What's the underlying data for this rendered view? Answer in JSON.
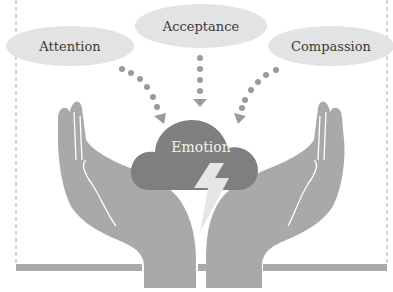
{
  "diagram": {
    "concepts": [
      {
        "id": "attention",
        "label": "Attention"
      },
      {
        "id": "acceptance",
        "label": "Acceptance"
      },
      {
        "id": "compassion",
        "label": "Compassion"
      }
    ],
    "center": {
      "label": "Emotion",
      "shape": "cloud",
      "icon": "lightning-bolt-icon"
    },
    "support": {
      "shape": "two-open-hands"
    },
    "edges": [
      {
        "from": "attention",
        "to": "emotion",
        "style": "dotted-arrow"
      },
      {
        "from": "acceptance",
        "to": "emotion",
        "style": "dotted-arrow"
      },
      {
        "from": "compassion",
        "to": "emotion",
        "style": "dotted-arrow"
      }
    ],
    "colors": {
      "ellipse_fill": "#e3e3e3",
      "cloud_fill": "#7f7f7f",
      "hand_fill": "#a9a9a9",
      "dots": "#9a9a9a",
      "bolt": "#e6e6e6",
      "border": "#9a9a9a"
    }
  }
}
